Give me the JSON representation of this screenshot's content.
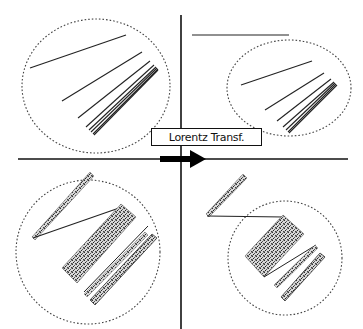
{
  "diagram": {
    "label": "Lorentz Transf.",
    "colors": {
      "axis": "#111111",
      "line": "#333333",
      "ellipse_border": "#444444",
      "speckle": "#555555",
      "background": "#ffffff"
    },
    "quadrants": [
      {
        "position": "top-left",
        "content": "dashed ellipse containing fanned lines (5 lines converging bottom-right)"
      },
      {
        "position": "top-right",
        "content": "horizontal line above a smaller dashed ellipse containing contracted fanned lines"
      },
      {
        "position": "bottom-left",
        "content": "dashed circle containing speckled strip, speckled rectangle, connecting line and striped bars"
      },
      {
        "position": "bottom-right",
        "content": "speckled strip outside a smaller dashed circle containing contracted speckled rectangle and bars, joined by a line"
      }
    ],
    "arrow": {
      "direction": "right",
      "meaning": "transformation"
    }
  }
}
